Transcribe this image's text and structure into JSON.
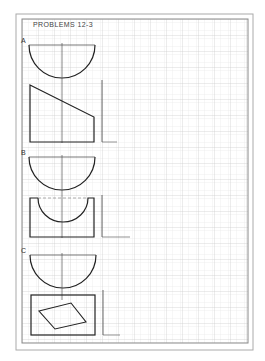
{
  "sheet": {
    "title": "PROBLEMS 12-3",
    "outer_border": {
      "x": 16,
      "y": 14,
      "w": 237,
      "h": 336
    },
    "inner_frame": {
      "x": 22,
      "y": 19,
      "w": 226,
      "h": 324
    },
    "grid": {
      "spacing": 8,
      "major_every": 2,
      "minor_color": "#e2e2e2",
      "major_color": "#c8c8c8"
    },
    "colors": {
      "ink": "#222222",
      "frame": "#9a9a9a",
      "center_line": "#555555"
    }
  },
  "problems": [
    {
      "label": "A",
      "label_pos": {
        "x": 21,
        "y": 37
      },
      "top_view": {
        "type": "semicircle",
        "cx": 62,
        "cy": 45,
        "r": 33,
        "x1": 29,
        "x2": 95
      },
      "front_view": {
        "type": "polygon",
        "points": "30,85 94,117 94,142 30,142"
      },
      "center_line": {
        "x": 62,
        "y1": 43,
        "y2": 143
      },
      "side_guide": {
        "x": 102,
        "y1": 80,
        "y2": 142,
        "stub_x2": 117
      }
    },
    {
      "label": "B",
      "label_pos": {
        "x": 21,
        "y": 149
      },
      "top_view": {
        "type": "semicircle",
        "cx": 62,
        "cy": 157,
        "r": 33,
        "x1": 29,
        "x2": 95
      },
      "front_view": {
        "type": "u-block",
        "x1": 30,
        "x2": 94,
        "y_top": 198,
        "y_bottom": 237,
        "cut_x1": 38,
        "cut_x2": 88,
        "cut_depth": 24
      },
      "center_line": {
        "x": 62,
        "y1": 155,
        "y2": 238
      },
      "side_guide": {
        "x": 102,
        "y1": 195,
        "y2": 237,
        "stub_x2": 130
      }
    },
    {
      "label": "C",
      "label_pos": {
        "x": 21,
        "y": 247
      },
      "top_view": {
        "type": "semicircle",
        "cx": 62,
        "cy": 255,
        "r": 33,
        "x1": 30,
        "x2": 96
      },
      "front_view": {
        "type": "rect-with-diamond",
        "x": 31,
        "y": 295,
        "w": 64,
        "h": 40,
        "diamond": "39,311 71,303 86,322 55,329"
      },
      "center_line": {
        "x": 62,
        "y1": 253,
        "y2": 300
      },
      "side_guide": {
        "x": 103,
        "y1": 290,
        "y2": 335,
        "stub_x2": 120
      }
    }
  ]
}
